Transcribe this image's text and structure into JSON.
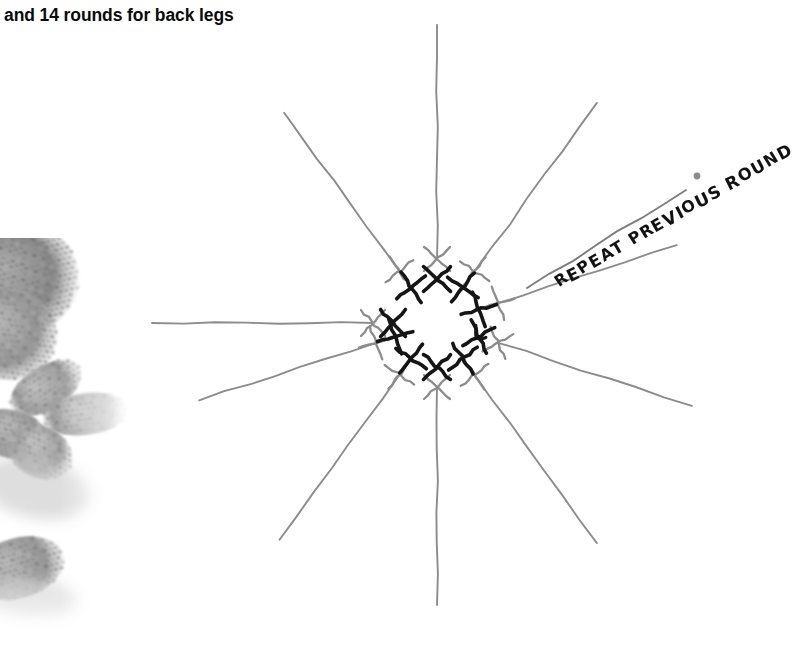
{
  "page": {
    "background": "#ffffff",
    "width": 784,
    "height": 656
  },
  "caption": {
    "text": "and 14 rounds for back legs"
  },
  "photo": {
    "alt_label": "crocheted amigurumi toy legs photo",
    "tint": "#9a9a9a"
  },
  "annotation": {
    "text": "REPEAT PREVIOUS ROUND",
    "rotation_deg": -30,
    "color": "#121212",
    "pointer_dot_color": "#8c8c8c"
  },
  "chart_data": {
    "type": "diagram",
    "symbol_legend": [
      {
        "symbol": "X",
        "name": "single-crochet",
        "color_outer": "#8c8c8c",
        "color_inner": "#151515"
      },
      {
        "symbol": "curl",
        "name": "round-start-marker",
        "color": "#151515"
      }
    ],
    "center": {
      "x": 437,
      "y": 323
    },
    "colors": {
      "spoke": "#8c8c8c",
      "outer_symbol": "#8c8c8c",
      "inner_symbol": "#151515",
      "pointer": "#7d7d7d"
    },
    "spokes": [
      {
        "index": 1,
        "angle_deg": -90,
        "length": 298,
        "outer_symbol": "+",
        "inner_symbol": "+"
      },
      {
        "index": 2,
        "angle_deg": -54,
        "length": 272,
        "outer_symbol": "X",
        "inner_symbol": "X"
      },
      {
        "index": 3,
        "angle_deg": -18,
        "length": 252,
        "outer_symbol": "X",
        "inner_symbol": "X",
        "has_marker": true
      },
      {
        "index": 4,
        "angle_deg": 18,
        "length": 268,
        "outer_symbol": "+",
        "inner_symbol": "+"
      },
      {
        "index": 5,
        "angle_deg": 54,
        "length": 272,
        "outer_symbol": "X",
        "inner_symbol": "X"
      },
      {
        "index": 6,
        "angle_deg": 90,
        "length": 282,
        "outer_symbol": "+",
        "inner_symbol": "+"
      },
      {
        "index": 7,
        "angle_deg": 126,
        "length": 268,
        "outer_symbol": "X",
        "inner_symbol": "X"
      },
      {
        "index": 8,
        "angle_deg": 162,
        "length": 250,
        "outer_symbol": "X",
        "inner_symbol": "X"
      },
      {
        "index": 9,
        "angle_deg": 180,
        "length": 285,
        "outer_symbol": "+",
        "inner_symbol": "+"
      },
      {
        "index": 10,
        "angle_deg": -126,
        "length": 260,
        "outer_symbol": "X",
        "inner_symbol": "X"
      }
    ],
    "pointer_line": {
      "x1": 527,
      "y1": 288,
      "x2": 686,
      "y2": 190
    },
    "pointer_dot": {
      "x": 697,
      "y": 176,
      "r": 3.4
    }
  }
}
